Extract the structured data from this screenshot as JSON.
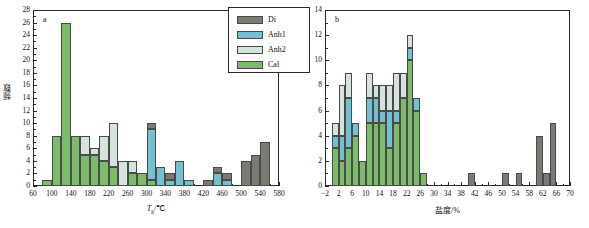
{
  "figure": {
    "panels": [
      "a",
      "b"
    ]
  },
  "legend": {
    "position": "top-right-of-panel-a",
    "entries": [
      {
        "label": "Di",
        "color": "#7b7a72"
      },
      {
        "label": "Anh1",
        "color": "#74bfd0"
      },
      {
        "label": "Anh2",
        "color": "#d5e3dd"
      },
      {
        "label": "Cal",
        "color": "#7dbb6c"
      }
    ]
  },
  "chart_data": [
    {
      "type": "bar",
      "id": "a",
      "panel_label": "a",
      "title": "",
      "xlabel": "Tₕ/℃",
      "xlabel_main": "T",
      "xlabel_sub": "h",
      "xlabel_unit": "/℃",
      "ylabel": "频数",
      "stacked": true,
      "grid": false,
      "bin_width": 20,
      "xlim": [
        60,
        580
      ],
      "ylim": [
        0,
        28
      ],
      "xticks": [
        60,
        100,
        140,
        180,
        220,
        260,
        300,
        340,
        380,
        420,
        460,
        500,
        540,
        580
      ],
      "xticklabels": [
        "60",
        "100",
        "140",
        "180",
        "220",
        "260",
        "300",
        "340",
        "380",
        "420",
        "460",
        "500",
        "540",
        "580"
      ],
      "yticks": [
        0,
        2,
        4,
        6,
        8,
        10,
        12,
        14,
        16,
        18,
        20,
        22,
        24,
        26,
        28
      ],
      "yticklabels": [
        "0",
        "2",
        "4",
        "6",
        "8",
        "10",
        "12",
        "14",
        "16",
        "18",
        "20",
        "22",
        "24",
        "26",
        "28"
      ],
      "categories": [
        "80",
        "100",
        "120",
        "140",
        "160",
        "180",
        "200",
        "220",
        "240",
        "260",
        "280",
        "300",
        "320",
        "340",
        "360",
        "380",
        "400",
        "420",
        "440",
        "460",
        "480",
        "500",
        "520",
        "540",
        "560"
      ],
      "bin_starts": [
        80,
        100,
        120,
        140,
        160,
        180,
        200,
        220,
        240,
        260,
        280,
        300,
        320,
        340,
        360,
        380,
        400,
        420,
        440,
        460,
        480,
        500,
        520,
        540,
        560
      ],
      "series": [
        {
          "name": "Cal",
          "color": "#7dbb6c",
          "values": [
            1,
            8,
            26,
            8,
            5,
            5,
            4,
            3,
            0,
            2,
            2,
            1,
            0,
            0,
            0,
            0,
            0,
            0,
            0,
            0,
            0,
            0,
            0,
            0,
            0
          ]
        },
        {
          "name": "Anh2",
          "color": "#d5e3dd",
          "values": [
            0,
            0,
            0,
            0,
            3,
            1,
            4,
            7,
            4,
            2,
            0,
            0,
            0,
            0,
            0,
            0,
            0,
            0,
            0,
            0,
            0,
            0,
            0,
            0,
            0
          ]
        },
        {
          "name": "Anh1",
          "color": "#74bfd0",
          "values": [
            0,
            0,
            0,
            0,
            0,
            0,
            0,
            0,
            0,
            0,
            0,
            8,
            3,
            1,
            4,
            1,
            0,
            0,
            2,
            1,
            0,
            0,
            0,
            0,
            0
          ]
        },
        {
          "name": "Di",
          "color": "#7b7a72",
          "values": [
            0,
            0,
            0,
            0,
            0,
            0,
            0,
            0,
            0,
            0,
            0,
            1,
            0,
            1,
            0,
            0,
            0,
            1,
            1,
            1,
            0,
            4,
            5,
            7,
            0
          ]
        }
      ]
    },
    {
      "type": "bar",
      "id": "b",
      "panel_label": "b",
      "title": "",
      "xlabel": "盐度/%",
      "ylabel": "",
      "stacked": true,
      "grid": false,
      "bin_width": 2,
      "xlim": [
        -2,
        70
      ],
      "ylim": [
        0,
        14
      ],
      "xticks": [
        -2,
        2,
        6,
        10,
        14,
        18,
        22,
        26,
        30,
        34,
        38,
        42,
        46,
        50,
        54,
        58,
        62,
        66,
        70
      ],
      "xticklabels": [
        "−2",
        "2",
        "6",
        "10",
        "14",
        "18",
        "22",
        "26",
        "30",
        "34",
        "38",
        "42",
        "46",
        "50",
        "54",
        "58",
        "62",
        "66",
        "70"
      ],
      "yticks": [
        0,
        2,
        4,
        6,
        8,
        10,
        12,
        14
      ],
      "yticklabels": [
        "0",
        "2",
        "4",
        "6",
        "8",
        "10",
        "12",
        "14"
      ],
      "categories": [
        "0",
        "2",
        "4",
        "6",
        "8",
        "10",
        "12",
        "14",
        "16",
        "18",
        "20",
        "22",
        "24",
        "26",
        "40",
        "50",
        "54",
        "60",
        "62",
        "64"
      ],
      "bin_starts": [
        0,
        2,
        4,
        6,
        8,
        10,
        12,
        14,
        16,
        18,
        20,
        22,
        24,
        26,
        40,
        50,
        54,
        60,
        62,
        64
      ],
      "series": [
        {
          "name": "Cal",
          "color": "#7dbb6c",
          "values": [
            3,
            2,
            3,
            4,
            2,
            5,
            5,
            5,
            3,
            5,
            7,
            10,
            6,
            1,
            0,
            0,
            0,
            0,
            0,
            0
          ]
        },
        {
          "name": "Anh1",
          "color": "#74bfd0",
          "values": [
            1,
            2,
            4,
            1,
            0,
            2,
            2,
            1,
            3,
            1,
            0,
            1,
            1,
            0,
            0,
            0,
            0,
            0,
            0,
            0
          ]
        },
        {
          "name": "Anh2",
          "color": "#d5e3dd",
          "values": [
            1,
            4,
            2,
            0,
            0,
            2,
            1,
            2,
            2,
            3,
            2,
            1,
            0,
            0,
            0,
            0,
            0,
            0,
            0,
            0
          ]
        },
        {
          "name": "Di",
          "color": "#7b7a72",
          "values": [
            0,
            0,
            0,
            0,
            0,
            0,
            0,
            0,
            0,
            0,
            0,
            0,
            0,
            0,
            1,
            1,
            1,
            4,
            1,
            5
          ]
        }
      ]
    }
  ]
}
